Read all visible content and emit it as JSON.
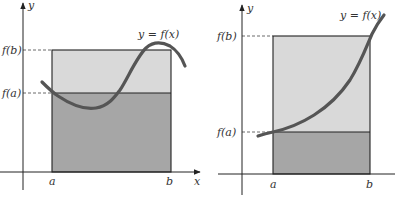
{
  "colors": {
    "light_region": "#d9d9d9",
    "dark_region": "#a6a6a6",
    "curve": "#555555",
    "axes": "#222222"
  },
  "diagrams": [
    {
      "id": "left",
      "description": "Non-monotonic function on [a,b]; area under curve bounded between f(a)(b-a) and f(b)(b-a) rectangles",
      "y_axis_label": "y",
      "x_axis_label": "x",
      "curve_label": "y = f(x)",
      "tick_labels": {
        "fa": "f(a)",
        "fb": "f(b)",
        "a": "a",
        "b": "b"
      }
    },
    {
      "id": "right",
      "description": "Increasing function on [a,b]; lower rectangle height f(a), upper rectangle height f(b)",
      "y_axis_label": "y",
      "curve_label": "y = f(x)",
      "tick_labels": {
        "fa": "f(a)",
        "fb": "f(b)",
        "a": "a",
        "b": "b"
      }
    }
  ]
}
